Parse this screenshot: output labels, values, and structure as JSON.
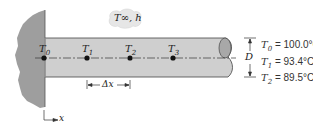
{
  "diagram": {
    "ambient_label": "T∞, h",
    "nodes": [
      {
        "label": "T",
        "sub": "0",
        "x": 44
      },
      {
        "label": "T",
        "sub": "1",
        "x": 87
      },
      {
        "label": "T",
        "sub": "2",
        "x": 130
      },
      {
        "label": "T",
        "sub": "3",
        "x": 173
      }
    ],
    "spacing_label": "Δx",
    "diameter_label": "D",
    "axis_label": "x",
    "given_values": [
      {
        "sym": "T",
        "sub": "0",
        "value": "= 100.0°C"
      },
      {
        "sym": "T",
        "sub": "1",
        "value": "= 93.4°C"
      },
      {
        "sym": "T",
        "sub": "2",
        "value": "= 89.5°C"
      }
    ],
    "colors": {
      "wall": "#9e9e9e",
      "rod": "#cfcfcf",
      "rod_end": "#a8a8a8",
      "cloud": "#e6e6e6",
      "line": "#333333"
    }
  }
}
